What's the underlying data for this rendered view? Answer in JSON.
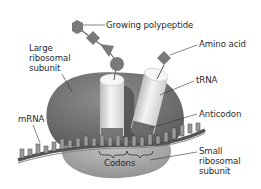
{
  "diagram": {
    "colors": {
      "large_subunit": "#7d7d7d",
      "small_subunit": "#a9a9a9",
      "trna": "#e6e6e6",
      "polypeptide": "#7a7a7a",
      "mrna": "#6a6a6a",
      "label_text": "#2a2a2a"
    },
    "labels": {
      "growing_polypeptide": "Growing polypeptide",
      "amino_acid": "Amino acid",
      "large_ribosomal_subunit": "Large\nribosomal\nsubunit",
      "trna": "tRNA",
      "anticodon": "Anticodon",
      "mrna": "mRNA",
      "codons": "Codons",
      "small_ribosomal_subunit": "Small\nribosomal\nsubunit"
    },
    "polypeptide_chain": [
      "hexagon",
      "diamond",
      "triangle",
      "circle"
    ]
  }
}
